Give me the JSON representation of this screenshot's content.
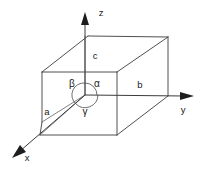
{
  "figure": {
    "background_color": "#ffffff",
    "line_color": "#3c3c3c",
    "text_color": "#1a1a1a",
    "width": 208,
    "height": 169
  },
  "axes": [
    {
      "id": "x",
      "label": "x",
      "label_x": 27,
      "label_y": 155,
      "direction": "down-left"
    },
    {
      "id": "y",
      "label": "y",
      "label_x": 183,
      "label_y": 108,
      "direction": "right"
    },
    {
      "id": "z",
      "label": "z",
      "label_x": 101,
      "label_y": 13,
      "direction": "up"
    }
  ],
  "edge_labels": [
    {
      "id": "a",
      "label": "a",
      "x": 47,
      "y": 112
    },
    {
      "id": "b",
      "label": "b",
      "x": 140,
      "y": 85
    },
    {
      "id": "c",
      "label": "c",
      "x": 95,
      "y": 56
    }
  ],
  "angle_labels": [
    {
      "id": "alpha",
      "label": "α",
      "x": 96,
      "y": 85
    },
    {
      "id": "beta",
      "label": "β",
      "x": 72,
      "y": 84
    },
    {
      "id": "gamma",
      "label": "γ",
      "x": 85,
      "y": 110
    }
  ],
  "origin": {
    "x": 85,
    "y": 95
  },
  "cell_vertices": {
    "top_back_left": {
      "x": 42,
      "y": 72
    },
    "top_back_right": {
      "x": 117,
      "y": 72
    },
    "top_far_left": {
      "x": 88,
      "y": 36
    },
    "top_far_right": {
      "x": 168,
      "y": 37
    },
    "bottom_front_left": {
      "x": 40,
      "y": 135
    },
    "bottom_front_right": {
      "x": 117,
      "y": 135
    },
    "mid_right": {
      "x": 168,
      "y": 96
    },
    "left_low": {
      "x": 42,
      "y": 122
    }
  }
}
